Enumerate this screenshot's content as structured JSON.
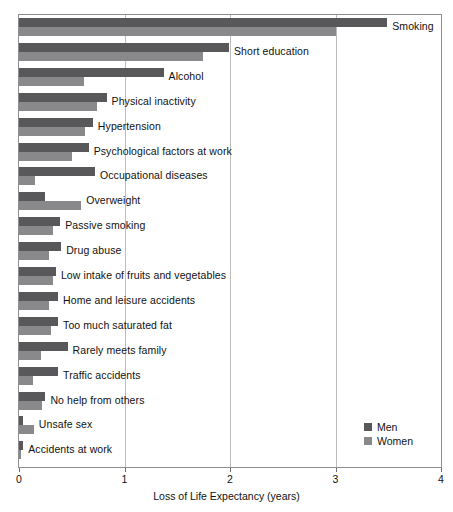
{
  "chart_data": {
    "type": "bar",
    "orientation": "horizontal",
    "title": "",
    "xlabel": "Loss of Life Expectancy (years)",
    "ylabel": "",
    "xlim": [
      0,
      4
    ],
    "xticks": [
      0,
      1,
      2,
      3,
      4
    ],
    "xticklabels": [
      "0",
      "1",
      "2",
      "3",
      "4"
    ],
    "grid": "vertical",
    "legend_position": "center-right",
    "categories": [
      "Smoking",
      "Short education",
      "Alcohol",
      "Physical inactivity",
      "Hypertension",
      "Psychological factors at work",
      "Occupational diseases",
      "Overweight",
      "Passive smoking",
      "Drug abuse",
      "Low intake of fruits and vegetables",
      "Home and leisure accidents",
      "Too much saturated fat",
      "Rarely meets family",
      "Traffic accidents",
      "No help from others",
      "Unsafe sex",
      "Accidents at work"
    ],
    "series": [
      {
        "name": "Men",
        "color": "#58585a",
        "values": [
          3.49,
          1.99,
          1.37,
          0.83,
          0.7,
          0.66,
          0.72,
          0.25,
          0.39,
          0.4,
          0.35,
          0.37,
          0.37,
          0.46,
          0.37,
          0.25,
          0.04,
          0.04
        ]
      },
      {
        "name": "Women",
        "color": "#89898b",
        "values": [
          3.0,
          1.74,
          0.62,
          0.74,
          0.63,
          0.5,
          0.15,
          0.59,
          0.32,
          0.28,
          0.32,
          0.28,
          0.3,
          0.21,
          0.13,
          0.22,
          0.14,
          0.02
        ]
      }
    ]
  },
  "legend": {
    "items": [
      {
        "label": "Men",
        "color": "#58585a"
      },
      {
        "label": "Women",
        "color": "#89898b"
      }
    ]
  }
}
